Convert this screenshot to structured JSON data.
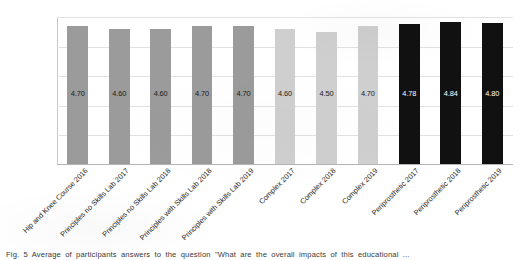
{
  "chart_data": {
    "type": "bar",
    "title": "",
    "subtitle": "",
    "xlabel": "",
    "ylabel": "",
    "ylim": [
      0,
      5
    ],
    "yticks": [
      "0",
      "1",
      "2",
      "3",
      "4",
      "5"
    ],
    "grid": true,
    "legend": "none",
    "categories": [
      "Hip and Knee Course 2016",
      "Principles no Skills Lab 2017",
      "Principles no Skills Lab 2018",
      "Principles with Skills Lab 2018",
      "Principles with Skills Lab 2019",
      "Complex 2017",
      "Complex 2018",
      "Complex 2019",
      "Periprosthetic 2017",
      "Periprosthetic 2018",
      "Periprosthetic 2019"
    ],
    "values": [
      4.7,
      4.6,
      4.6,
      4.7,
      4.7,
      4.6,
      4.5,
      4.7,
      4.78,
      4.84,
      4.8
    ],
    "value_labels": [
      "4.70",
      "4.60",
      "4.60",
      "4.70",
      "4.70",
      "4.60",
      "4.50",
      "4.70",
      "4.78",
      "4.84",
      "4.80"
    ],
    "bar_colors": [
      "#9b9b9b",
      "#9b9b9b",
      "#9b9b9b",
      "#9b9b9b",
      "#9b9b9b",
      "#cfcfcf",
      "#cfcfcf",
      "#cfcfcf",
      "#111111",
      "#111111",
      "#111111"
    ],
    "label_colors": [
      "#1a1a1a",
      "#1a1a1a",
      "#1a1a1a",
      "#1a1a1a",
      "#1a1a1a",
      "#1a1a1a",
      "#1a1a1a",
      "#1a1a1a",
      "#ffffff",
      "#ffffff",
      "#ffffff"
    ],
    "groups": [
      {
        "name": "Principles / Hip and Knee",
        "color": "#9b9b9b",
        "count": 5
      },
      {
        "name": "Complex",
        "color": "#cfcfcf",
        "count": 3
      },
      {
        "name": "Periprosthetic",
        "color": "#111111",
        "count": 3
      }
    ]
  },
  "caption": {
    "text": "Fig. 5  Average of participants answers to the question \"What are the overall impacts of this educational ..."
  }
}
